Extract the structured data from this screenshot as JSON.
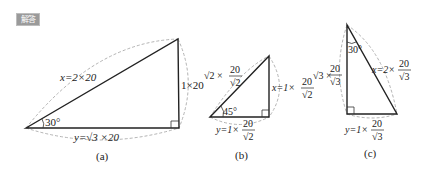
{
  "badge": {
    "label": "解答",
    "color": "#9a9a9a"
  },
  "figures": [
    {
      "id": "a",
      "caption": "(a)",
      "angle": "30°",
      "hypotenuse": "x=2×20",
      "vertical": "1×20",
      "base": "y=√3 ×20"
    },
    {
      "id": "b",
      "caption": "(b)",
      "angle": "45°",
      "hypotenuse_prefix": "√2 ×",
      "hypotenuse_num": "20",
      "hypotenuse_den": "√2",
      "vertical_prefix": "x=1×",
      "vertical_num": "20",
      "vertical_den": "√2",
      "base_prefix": "y=1×",
      "base_num": "20",
      "base_den": "√2"
    },
    {
      "id": "c",
      "caption": "(c)",
      "angle": "30°",
      "vertical_prefix": "√3 ×",
      "vertical_num": "20",
      "vertical_den": "√3",
      "hypotenuse_prefix": "x=2×",
      "hypotenuse_num": "20",
      "hypotenuse_den": "√3",
      "base_prefix": "y=1×",
      "base_num": "20",
      "base_den": "√3"
    }
  ]
}
